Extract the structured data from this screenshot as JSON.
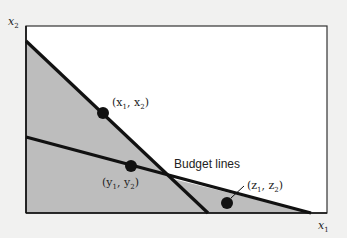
{
  "diagram": {
    "title": "",
    "axes": {
      "x_label": "x",
      "x_sub": "1",
      "y_label": "x",
      "y_sub": "2"
    },
    "budget_lines_label": "Budget lines",
    "points": [
      {
        "id": "x",
        "label": "(x",
        "label_mid": ", x",
        "label_end": ")",
        "sub1": "1",
        "sub2": "2"
      },
      {
        "id": "y",
        "label": "(y",
        "label_mid": ", y",
        "label_end": ")",
        "sub1": "1",
        "sub2": "2"
      },
      {
        "id": "z",
        "label": "(z",
        "label_mid": ", z",
        "label_end": ")",
        "sub1": "1",
        "sub2": "2"
      }
    ],
    "colors": {
      "background": "#f1f1f0",
      "plot_area": "#ffffff",
      "shaded_region": "#bdbdbd",
      "lines": "#111111"
    }
  }
}
